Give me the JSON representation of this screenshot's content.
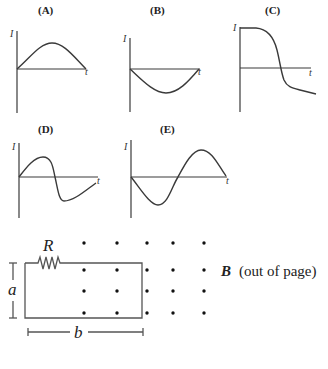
{
  "graphs": [
    {
      "label": "(A)",
      "y_axis_label": "I",
      "x_axis_label": "t",
      "shape": "positive half-sine hump"
    },
    {
      "label": "(B)",
      "y_axis_label": "I",
      "x_axis_label": "t",
      "shape": "negative half-sine trough"
    },
    {
      "label": "(C)",
      "y_axis_label": "I",
      "x_axis_label": "t",
      "shape": "high plateau dropping steeply to negative value"
    },
    {
      "label": "(D)",
      "y_axis_label": "I",
      "x_axis_label": "t",
      "shape": "positive hump then sharp drop to negative trough, recovering toward zero"
    },
    {
      "label": "(E)",
      "y_axis_label": "I",
      "x_axis_label": "t",
      "shape": "negative trough then positive peak (inverted sine)"
    }
  ],
  "circuit": {
    "resistor_label": "R",
    "height_label": "a",
    "width_label": "b",
    "field_symbol": "B",
    "field_description": "(out of page)",
    "field_grid": {
      "rows": 4,
      "columns": 5
    }
  }
}
